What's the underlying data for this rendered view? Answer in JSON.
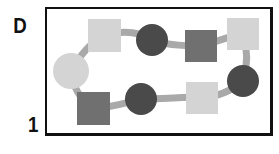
{
  "labels": {
    "top": "D",
    "bottom": "1"
  },
  "colors": {
    "light": "#d4d4d4",
    "medium": "#707070",
    "dark": "#4a4a4a",
    "connector": "#a9a9a9",
    "frame": "#111111"
  },
  "shapes": [
    {
      "type": "square",
      "tone": "light",
      "x": 88,
      "y": 19,
      "size": 33
    },
    {
      "type": "circle",
      "tone": "dark",
      "cx": 152,
      "cy": 40,
      "r": 16
    },
    {
      "type": "square",
      "tone": "medium",
      "x": 185,
      "y": 30,
      "size": 32
    },
    {
      "type": "square",
      "tone": "light",
      "x": 227,
      "y": 18,
      "size": 32
    },
    {
      "type": "circle",
      "tone": "light",
      "cx": 71,
      "cy": 71,
      "r": 18
    },
    {
      "type": "circle",
      "tone": "dark",
      "cx": 243,
      "cy": 81,
      "r": 16
    },
    {
      "type": "square",
      "tone": "medium",
      "x": 77,
      "y": 92,
      "size": 33
    },
    {
      "type": "circle",
      "tone": "dark",
      "cx": 141,
      "cy": 99,
      "r": 16
    },
    {
      "type": "square",
      "tone": "light",
      "x": 186,
      "y": 82,
      "size": 32
    }
  ]
}
